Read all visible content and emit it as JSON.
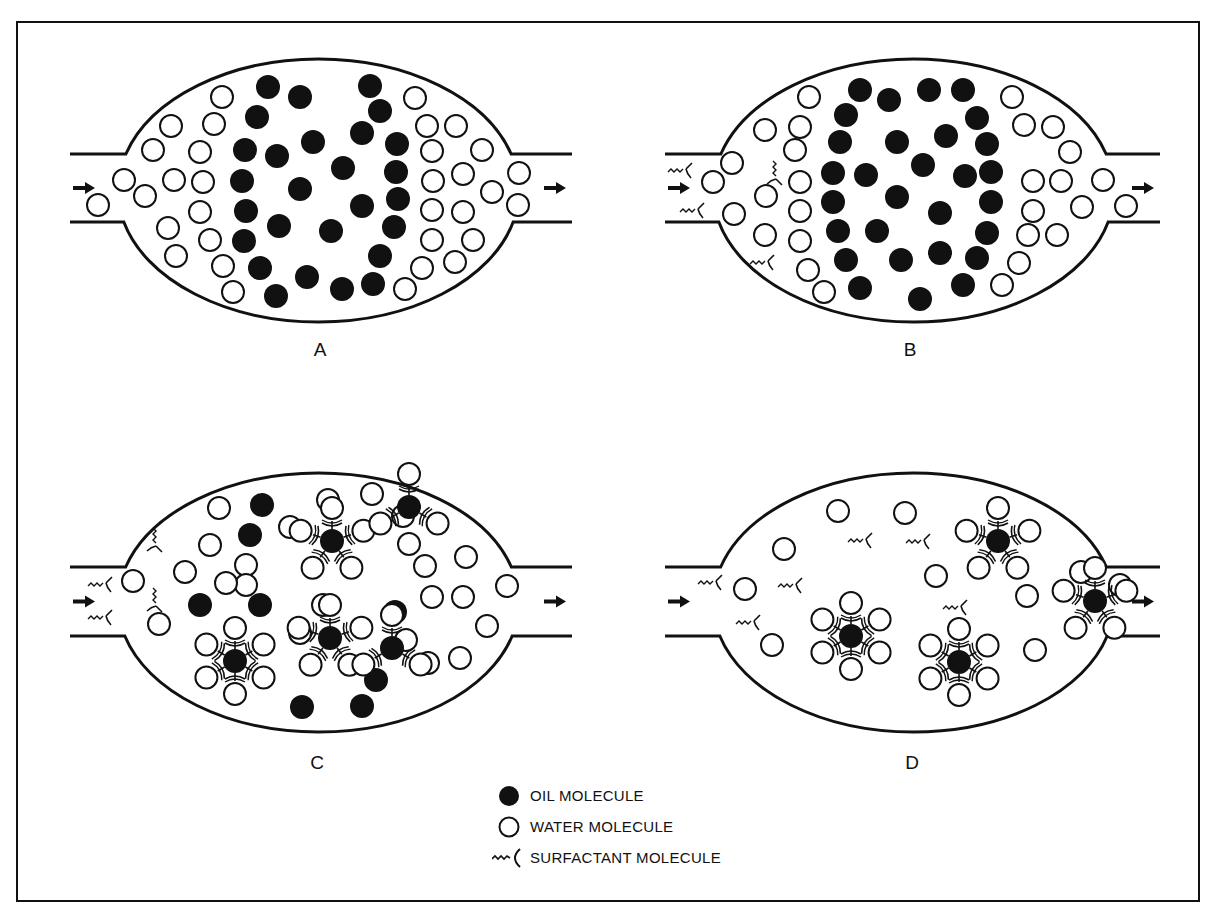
{
  "figure": {
    "panels": [
      {
        "id": "A",
        "label": "A",
        "x0": 70,
        "y_top": 59,
        "y_bot": 322,
        "pipe_top": 154,
        "pipe_bot": 222,
        "vessel_left": 130,
        "vessel_right": 507,
        "pipe_end": 572,
        "oil": [
          [
            268,
            87
          ],
          [
            300,
            97
          ],
          [
            370,
            86
          ],
          [
            257,
            117
          ],
          [
            380,
            111
          ],
          [
            362,
            133
          ],
          [
            313,
            142
          ],
          [
            245,
            150
          ],
          [
            277,
            156
          ],
          [
            343,
            168
          ],
          [
            397,
            144
          ],
          [
            242,
            181
          ],
          [
            300,
            189
          ],
          [
            396,
            172
          ],
          [
            246,
            211
          ],
          [
            362,
            206
          ],
          [
            398,
            199
          ],
          [
            279,
            226
          ],
          [
            331,
            231
          ],
          [
            244,
            241
          ],
          [
            394,
            227
          ],
          [
            260,
            268
          ],
          [
            307,
            277
          ],
          [
            380,
            256
          ],
          [
            276,
            296
          ],
          [
            342,
            289
          ],
          [
            373,
            284
          ]
        ],
        "water": [
          [
            222,
            97
          ],
          [
            415,
            98
          ],
          [
            171,
            126
          ],
          [
            214,
            124
          ],
          [
            427,
            126
          ],
          [
            456,
            126
          ],
          [
            153,
            150
          ],
          [
            200,
            152
          ],
          [
            432,
            151
          ],
          [
            482,
            150
          ],
          [
            124,
            180
          ],
          [
            174,
            180
          ],
          [
            203,
            182
          ],
          [
            433,
            181
          ],
          [
            463,
            174
          ],
          [
            519,
            173
          ],
          [
            98,
            205
          ],
          [
            145,
            196
          ],
          [
            200,
            212
          ],
          [
            432,
            210
          ],
          [
            463,
            212
          ],
          [
            492,
            192
          ],
          [
            518,
            205
          ],
          [
            168,
            228
          ],
          [
            210,
            240
          ],
          [
            432,
            240
          ],
          [
            473,
            240
          ],
          [
            176,
            256
          ],
          [
            223,
            266
          ],
          [
            422,
            268
          ],
          [
            455,
            262
          ],
          [
            233,
            292
          ],
          [
            405,
            289
          ]
        ],
        "surfactants": [],
        "micelles": []
      },
      {
        "id": "B",
        "label": "B",
        "x0": 665,
        "y_top": 59,
        "y_bot": 322,
        "pipe_top": 154,
        "pipe_bot": 222,
        "vessel_left": 725,
        "vessel_right": 1102,
        "pipe_end": 1160,
        "oil": [
          [
            860,
            90
          ],
          [
            889,
            100
          ],
          [
            929,
            90
          ],
          [
            963,
            90
          ],
          [
            846,
            115
          ],
          [
            977,
            118
          ],
          [
            840,
            142
          ],
          [
            897,
            142
          ],
          [
            946,
            136
          ],
          [
            987,
            144
          ],
          [
            833,
            173
          ],
          [
            866,
            175
          ],
          [
            923,
            165
          ],
          [
            965,
            176
          ],
          [
            991,
            172
          ],
          [
            833,
            202
          ],
          [
            897,
            197
          ],
          [
            940,
            213
          ],
          [
            991,
            202
          ],
          [
            838,
            231
          ],
          [
            877,
            231
          ],
          [
            987,
            233
          ],
          [
            846,
            260
          ],
          [
            901,
            260
          ],
          [
            940,
            253
          ],
          [
            977,
            258
          ],
          [
            860,
            288
          ],
          [
            920,
            299
          ],
          [
            963,
            285
          ]
        ],
        "water": [
          [
            809,
            97
          ],
          [
            765,
            130
          ],
          [
            800,
            127
          ],
          [
            1012,
            97
          ],
          [
            1024,
            125
          ],
          [
            1053,
            127
          ],
          [
            1070,
            152
          ],
          [
            732,
            163
          ],
          [
            795,
            150
          ],
          [
            713,
            182
          ],
          [
            800,
            182
          ],
          [
            1033,
            181
          ],
          [
            1061,
            181
          ],
          [
            1103,
            180
          ],
          [
            766,
            196
          ],
          [
            1033,
            211
          ],
          [
            734,
            214
          ],
          [
            800,
            211
          ],
          [
            1082,
            207
          ],
          [
            1126,
            206
          ],
          [
            765,
            235
          ],
          [
            800,
            241
          ],
          [
            1028,
            235
          ],
          [
            1057,
            235
          ],
          [
            808,
            270
          ],
          [
            1019,
            263
          ],
          [
            824,
            292
          ],
          [
            1002,
            285
          ]
        ],
        "surfactants": [
          [
            680,
            170,
            0
          ],
          [
            692,
            210,
            0
          ],
          [
            775,
            173,
            90
          ],
          [
            762,
            262,
            0
          ]
        ],
        "micelles": []
      },
      {
        "id": "C",
        "label": "C",
        "x0": 70,
        "y_top": 473,
        "y_bot": 732,
        "pipe_top": 567,
        "pipe_bot": 636,
        "vessel_left": 130,
        "vessel_right": 507,
        "pipe_end": 572,
        "oil": [
          [
            262,
            505
          ],
          [
            250,
            535
          ],
          [
            200,
            605
          ],
          [
            260,
            605
          ],
          [
            395,
            612
          ],
          [
            376,
            680
          ],
          [
            362,
            706
          ],
          [
            302,
            707
          ]
        ],
        "water": [
          [
            219,
            508
          ],
          [
            210,
            545
          ],
          [
            246,
            565
          ],
          [
            185,
            572
          ],
          [
            133,
            581
          ],
          [
            159,
            624
          ],
          [
            290,
            527
          ],
          [
            328,
            500
          ],
          [
            372,
            494
          ],
          [
            403,
            516
          ],
          [
            409,
            544
          ],
          [
            425,
            566
          ],
          [
            466,
            557
          ],
          [
            432,
            597
          ],
          [
            463,
            597
          ],
          [
            507,
            586
          ],
          [
            487,
            626
          ],
          [
            460,
            658
          ],
          [
            428,
            663
          ],
          [
            406,
            640
          ],
          [
            300,
            633
          ],
          [
            323,
            605
          ],
          [
            246,
            585
          ],
          [
            226,
            583
          ]
        ],
        "surfactants": [
          [
            100,
            584,
            0
          ],
          [
            100,
            617,
            0
          ],
          [
            155,
            540,
            90
          ],
          [
            155,
            600,
            90
          ]
        ],
        "micelles": [
          [
            332,
            541,
            5
          ],
          [
            409,
            507,
            3
          ],
          [
            330,
            638,
            5
          ],
          [
            235,
            661,
            6
          ],
          [
            392,
            648,
            3
          ]
        ]
      },
      {
        "id": "D",
        "label": "D",
        "x0": 665,
        "y_top": 473,
        "y_bot": 732,
        "pipe_top": 567,
        "pipe_bot": 636,
        "vessel_left": 725,
        "vessel_right": 1102,
        "pipe_end": 1160,
        "oil": [],
        "water": [
          [
            838,
            511
          ],
          [
            905,
            513
          ],
          [
            784,
            549
          ],
          [
            745,
            589
          ],
          [
            936,
            576
          ],
          [
            1027,
            596
          ],
          [
            772,
            645
          ],
          [
            1035,
            650
          ],
          [
            1081,
            572
          ],
          [
            1120,
            585
          ]
        ],
        "surfactants": [
          [
            710,
            582,
            0
          ],
          [
            748,
            622,
            0
          ],
          [
            790,
            585,
            0
          ],
          [
            860,
            540,
            0
          ],
          [
            918,
            541,
            0
          ],
          [
            955,
            607,
            0
          ]
        ],
        "micelles": [
          [
            851,
            636,
            6
          ],
          [
            959,
            662,
            6
          ],
          [
            998,
            541,
            5
          ],
          [
            1095,
            601,
            5
          ]
        ]
      }
    ]
  },
  "legend": {
    "items": [
      {
        "icon": "oil-molecule-icon",
        "label": "OIL MOLECULE"
      },
      {
        "icon": "water-molecule-icon",
        "label": "WATER MOLECULE"
      },
      {
        "icon": "surfactant-molecule-icon",
        "label": "SURFACTANT MOLECULE"
      }
    ]
  },
  "style": {
    "ink": "#111111",
    "paper": "#ffffff"
  }
}
